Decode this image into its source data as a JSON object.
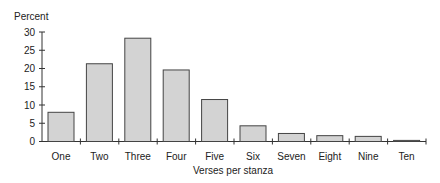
{
  "chart_data": {
    "type": "bar",
    "title": "",
    "ylabel": "Percent",
    "xlabel": "Verses per stanza",
    "categories": [
      "One",
      "Two",
      "Three",
      "Four",
      "Five",
      "Six",
      "Seven",
      "Eight",
      "Nine",
      "Ten"
    ],
    "values": [
      8.0,
      21.3,
      28.3,
      19.6,
      11.5,
      4.3,
      2.2,
      1.6,
      1.4,
      0.3
    ],
    "ylim": [
      0,
      30
    ],
    "yticks": [
      0,
      5,
      10,
      15,
      20,
      25,
      30
    ],
    "grid": false,
    "legend": null,
    "colors": {
      "bar_fill": "#d3d3d3",
      "bar_stroke": "#444444",
      "axis": "#333333"
    }
  }
}
